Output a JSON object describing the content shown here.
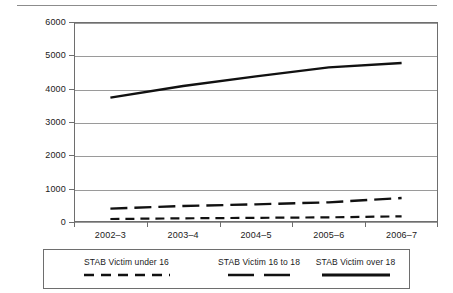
{
  "chart_data": {
    "type": "line",
    "title": "",
    "xlabel": "",
    "ylabel": "",
    "categories": [
      "2002–3",
      "2003–4",
      "2004–5",
      "2005–6",
      "2006–7"
    ],
    "ylim": [
      0,
      6000
    ],
    "y_ticks": [
      0,
      1000,
      2000,
      3000,
      4000,
      5000,
      6000
    ],
    "y_tick_labels": [
      "0",
      "1000",
      "2000",
      "3000",
      "4000",
      "5000",
      "6000"
    ],
    "grid": true,
    "legend_position": "bottom",
    "series": [
      {
        "name": "STAB Victim under 16",
        "values": [
          90,
          110,
          125,
          140,
          170
        ],
        "style": "dashed-thin",
        "color": "#111111"
      },
      {
        "name": "STAB Victim 16 to 18",
        "values": [
          400,
          480,
          530,
          590,
          720
        ],
        "style": "dashed-thick",
        "color": "#111111"
      },
      {
        "name": "STAB Victim over 18",
        "values": [
          3730,
          4080,
          4370,
          4640,
          4770
        ],
        "style": "solid-thick",
        "color": "#111111"
      }
    ]
  },
  "axis": {
    "y_label_0": "0",
    "y_label_1000": "1000",
    "y_label_2000": "2000",
    "y_label_3000": "3000",
    "y_label_4000": "4000",
    "y_label_5000": "5000",
    "y_label_6000": "6000"
  },
  "legend": {
    "items": [
      {
        "label": "STAB Victim under 16",
        "swatch": "dashed-thin"
      },
      {
        "label": "STAB Victim 16 to 18",
        "swatch": "dashed-thick"
      },
      {
        "label": "STAB Victim over 18",
        "swatch": "solid-thick"
      }
    ]
  },
  "colors": {
    "series_line": "#111111",
    "gridline": "#9a9a9a",
    "axis": "#6e6e6e",
    "rule": "#8c8c8c",
    "text": "#1a1a1a",
    "background": "#ffffff"
  }
}
